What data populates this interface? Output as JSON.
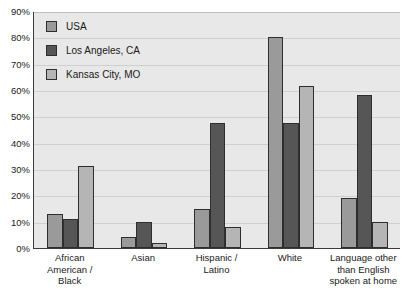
{
  "chart_data": {
    "type": "bar",
    "title": "",
    "subtitle": "",
    "xlabel": "",
    "ylabel": "",
    "ylim": [
      0,
      90
    ],
    "grid": true,
    "legend_position": "top-left-inside",
    "categories": [
      "African American / Black",
      "Asian",
      "Hispanic / Latino",
      "White",
      "Language other than English spoken at home"
    ],
    "series": [
      {
        "name": "USA",
        "color": "#9a9a9a",
        "values": [
          13,
          4,
          15,
          80,
          19
        ]
      },
      {
        "name": "Los Angeles, CA",
        "color": "#565656",
        "values": [
          11,
          10,
          47.5,
          47.5,
          58
        ]
      },
      {
        "name": "Kansas City, MO",
        "color": "#b5b5b5",
        "values": [
          31,
          2,
          8,
          61.5,
          10
        ]
      }
    ],
    "y_ticks": [
      {
        "value": 0,
        "label": "0%"
      },
      {
        "value": 10,
        "label": "10%"
      },
      {
        "value": 20,
        "label": "20%"
      },
      {
        "value": 30,
        "label": "30%"
      },
      {
        "value": 40,
        "label": "40%"
      },
      {
        "value": 50,
        "label": "50%"
      },
      {
        "value": 60,
        "label": "60%"
      },
      {
        "value": 70,
        "label": "70%"
      },
      {
        "value": 80,
        "label": "80%"
      },
      {
        "value": 90,
        "label": "90%"
      }
    ],
    "x_tick_labels": [
      [
        "African",
        "American /",
        "Black"
      ],
      [
        "Asian"
      ],
      [
        "Hispanic /",
        "Latino"
      ],
      [
        "White"
      ],
      [
        "Language other",
        "than English",
        "spoken at home"
      ]
    ]
  },
  "legend": {
    "items": [
      {
        "label": "USA",
        "color": "#9a9a9a"
      },
      {
        "label": "Los Angeles, CA",
        "color": "#565656"
      },
      {
        "label": "Kansas City, MO",
        "color": "#b5b5b5"
      }
    ]
  },
  "colors": {
    "plot_background": "#e8e8e8",
    "gridline": "#cfcfcf",
    "axis": "#3b3b3b",
    "bar_outline": "#2e2e2e",
    "text": "#1a1a1a"
  }
}
